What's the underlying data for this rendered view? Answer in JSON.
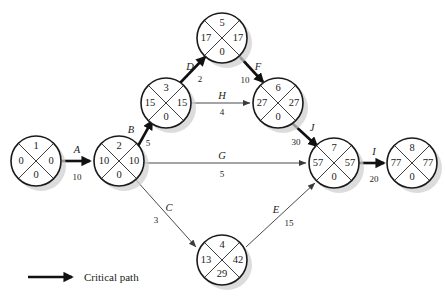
{
  "diagram": {
    "type": "activity-on-arrow-network",
    "title": "",
    "legend": {
      "label": "Critical path",
      "symbol": "thick-arrow"
    },
    "node_quadrants": {
      "top": "event number",
      "left": "earliest time",
      "right": "latest time",
      "bottom": "slack"
    },
    "nodes": [
      {
        "id": "1",
        "number": "1",
        "left": "0",
        "right": "0",
        "bottom": "0",
        "cx": 36,
        "cy": 161,
        "r": 25
      },
      {
        "id": "2",
        "number": "2",
        "left": "10",
        "right": "10",
        "bottom": "0",
        "cx": 119,
        "cy": 161,
        "r": 25
      },
      {
        "id": "3",
        "number": "3",
        "left": "15",
        "right": "15",
        "bottom": "0",
        "cx": 166,
        "cy": 103,
        "r": 25
      },
      {
        "id": "4",
        "number": "4",
        "left": "13",
        "right": "42",
        "bottom": "29",
        "cx": 222,
        "cy": 260,
        "r": 25
      },
      {
        "id": "5",
        "number": "5",
        "left": "17",
        "right": "17",
        "bottom": "0",
        "cx": 222,
        "cy": 38,
        "r": 25
      },
      {
        "id": "6",
        "number": "6",
        "left": "27",
        "right": "27",
        "bottom": "0",
        "cx": 278,
        "cy": 103,
        "r": 25
      },
      {
        "id": "7",
        "number": "7",
        "left": "57",
        "right": "57",
        "bottom": "0",
        "cx": 334,
        "cy": 163,
        "r": 25
      },
      {
        "id": "8",
        "number": "8",
        "left": "77",
        "right": "77",
        "bottom": "0",
        "cx": 412,
        "cy": 163,
        "r": 25
      }
    ],
    "activities": [
      {
        "id": "A",
        "label": "A",
        "duration": "10",
        "from": "1",
        "to": "2",
        "critical": true,
        "label_x": 77,
        "label_y": 153,
        "dur_x": 77,
        "dur_y": 178
      },
      {
        "id": "B",
        "label": "B",
        "duration": "5",
        "from": "2",
        "to": "3",
        "critical": true,
        "label_x": 131,
        "label_y": 130,
        "dur_x": 148,
        "dur_y": 143
      },
      {
        "id": "C",
        "label": "C",
        "duration": "3",
        "from": "2",
        "to": "4",
        "critical": false,
        "label_x": 167,
        "label_y": 208,
        "dur_x": 155,
        "dur_y": 221
      },
      {
        "id": "D",
        "label": "D",
        "duration": "2",
        "from": "3",
        "to": "5",
        "critical": true,
        "label_x": 190,
        "label_y": 68,
        "dur_x": 199,
        "dur_y": 80
      },
      {
        "id": "E",
        "label": "E",
        "duration": "15",
        "from": "4",
        "to": "7",
        "critical": false,
        "label_x": 274,
        "label_y": 211,
        "dur_x": 287,
        "dur_y": 224
      },
      {
        "id": "F",
        "label": "F",
        "duration": "10",
        "from": "5",
        "to": "6",
        "critical": true,
        "label_x": 257,
        "label_y": 68,
        "dur_x": 245,
        "dur_y": 80
      },
      {
        "id": "G",
        "label": "G",
        "duration": "5",
        "from": "2",
        "to": "7",
        "critical": false,
        "label_x": 222,
        "label_y": 159,
        "dur_x": 222,
        "dur_y": 176
      },
      {
        "id": "H",
        "label": "H",
        "duration": "4",
        "from": "3",
        "to": "6",
        "critical": false,
        "label_x": 222,
        "label_y": 97,
        "dur_x": 222,
        "dur_y": 113
      },
      {
        "id": "I",
        "label": "I",
        "duration": "20",
        "from": "7",
        "to": "8",
        "critical": true,
        "label_x": 373,
        "label_y": 155,
        "dur_x": 373,
        "dur_y": 180
      },
      {
        "id": "J",
        "label": "J",
        "duration": "30",
        "from": "6",
        "to": "7",
        "critical": true,
        "label_x": 311,
        "label_y": 129,
        "dur_x": 295,
        "dur_y": 142
      }
    ]
  }
}
